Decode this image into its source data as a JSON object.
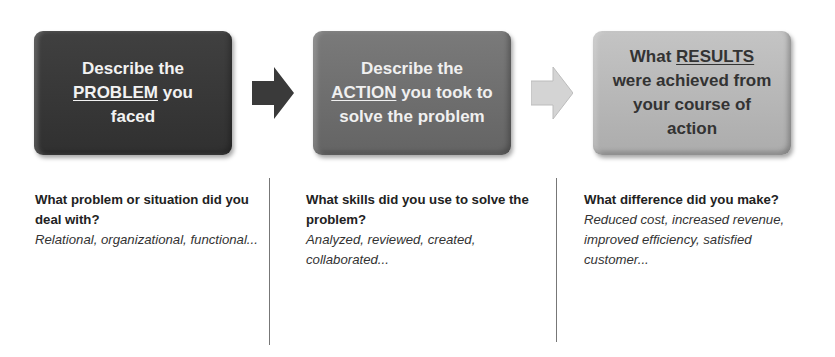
{
  "steps": [
    {
      "box": {
        "pre": "Describe the ",
        "key": "PROBLEM",
        "post": " you faced"
      },
      "question": "What problem or situation did you deal with?",
      "examples": "Relational, organizational, functional...",
      "fill": "#383838",
      "text_color": "#f2f2f2"
    },
    {
      "box": {
        "pre": "Describe the ",
        "key": "ACTION",
        "post": " you took to solve the problem"
      },
      "question": "What skills did you use to solve the problem?",
      "examples": "Analyzed, reviewed, created, collaborated...",
      "fill": "#6e6e6e",
      "text_color": "#f0f0f0"
    },
    {
      "box": {
        "pre": "What ",
        "key": "RESULTS",
        "post": " were achieved from your course of action"
      },
      "question": "What difference did you make?",
      "examples": "Reduced cost, increased revenue, improved efficiency, satisfied customer...",
      "fill": "#b8b8b8",
      "text_color": "#333333"
    }
  ],
  "arrows": [
    {
      "icon": "arrow-right-icon",
      "color": "#3a3a3a"
    },
    {
      "icon": "arrow-right-icon",
      "color": "#d0d0d0"
    }
  ]
}
